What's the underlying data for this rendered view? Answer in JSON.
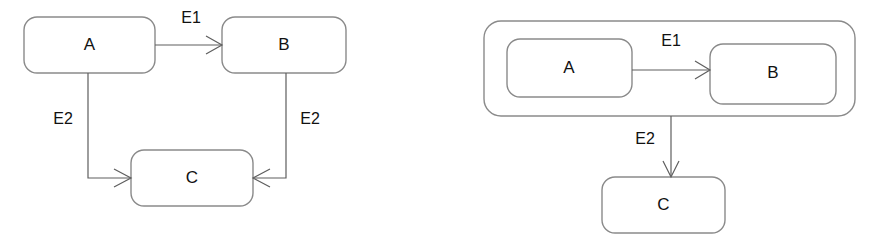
{
  "figure": {
    "background_color": "#ffffff",
    "stroke_color": "#8a8a8a",
    "edge_color": "#5e5e5e",
    "text_color": "#111111"
  },
  "diagrams": [
    {
      "id": "flat-diagram",
      "name": "flat-state-diagram",
      "nodes": [
        {
          "id": "a",
          "label": "A"
        },
        {
          "id": "b",
          "label": "B"
        },
        {
          "id": "c",
          "label": "C"
        }
      ],
      "edges": [
        {
          "id": "a-to-b",
          "label": "E1",
          "from": "A",
          "to": "B"
        },
        {
          "id": "a-to-c",
          "label": "E2",
          "from": "A",
          "to": "C"
        },
        {
          "id": "b-to-c",
          "label": "E2",
          "from": "B",
          "to": "C"
        }
      ]
    },
    {
      "id": "nested-diagram",
      "name": "nested-state-diagram",
      "container": {
        "id": "group",
        "label": ""
      },
      "nodes": [
        {
          "id": "a",
          "label": "A"
        },
        {
          "id": "b",
          "label": "B"
        },
        {
          "id": "c",
          "label": "C"
        }
      ],
      "edges": [
        {
          "id": "a-to-b",
          "label": "E1",
          "from": "A",
          "to": "B"
        },
        {
          "id": "group-to-c",
          "label": "E2",
          "from": "group",
          "to": "C"
        }
      ]
    }
  ]
}
